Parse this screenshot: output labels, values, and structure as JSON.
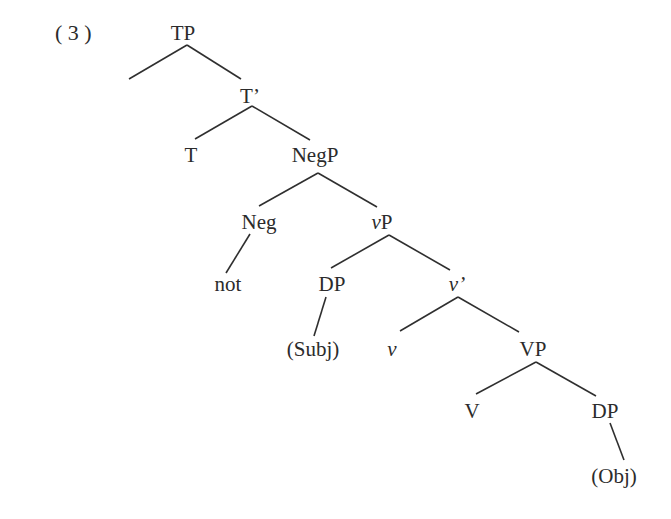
{
  "example_number": "( 3 )",
  "tree": {
    "nodes": [
      {
        "id": "TP",
        "label": "TP",
        "x": 183,
        "y": 40,
        "italic": false
      },
      {
        "id": "Tbar",
        "label": "T’",
        "x": 250,
        "y": 103,
        "italic": false
      },
      {
        "id": "T",
        "label": "T",
        "x": 191,
        "y": 162,
        "italic": false
      },
      {
        "id": "NegP",
        "label": "NegP",
        "x": 315,
        "y": 162,
        "italic": false
      },
      {
        "id": "Neg",
        "label": "Neg",
        "x": 259,
        "y": 229,
        "italic": false
      },
      {
        "id": "vP",
        "label": "vP",
        "x": 382,
        "y": 229,
        "italic": true
      },
      {
        "id": "not",
        "label": "not",
        "x": 228,
        "y": 291,
        "italic": false
      },
      {
        "id": "DP1",
        "label": "DP",
        "x": 332,
        "y": 291,
        "italic": false
      },
      {
        "id": "vbar",
        "label": "v’",
        "x": 457,
        "y": 291,
        "italic": true
      },
      {
        "id": "Subj",
        "label": "(Subj)",
        "x": 313,
        "y": 356,
        "italic": false
      },
      {
        "id": "v",
        "label": "v",
        "x": 392,
        "y": 356,
        "italic": true
      },
      {
        "id": "VP",
        "label": "VP",
        "x": 533,
        "y": 356,
        "italic": false
      },
      {
        "id": "V",
        "label": "V",
        "x": 472,
        "y": 418,
        "italic": false
      },
      {
        "id": "DP2",
        "label": "DP",
        "x": 605,
        "y": 418,
        "italic": false
      },
      {
        "id": "Obj",
        "label": "(Obj)",
        "x": 614,
        "y": 483,
        "italic": false
      }
    ],
    "edges": [
      {
        "from": "TP",
        "x1": 187,
        "y1": 45,
        "x2": 129,
        "y2": 79
      },
      {
        "from": "TP",
        "x1": 187,
        "y1": 45,
        "x2": 241,
        "y2": 79
      },
      {
        "from": "Tbar",
        "x1": 252,
        "y1": 106,
        "x2": 195,
        "y2": 139
      },
      {
        "from": "Tbar",
        "x1": 252,
        "y1": 106,
        "x2": 310,
        "y2": 140
      },
      {
        "from": "NegP",
        "x1": 318,
        "y1": 173,
        "x2": 259,
        "y2": 206
      },
      {
        "from": "NegP",
        "x1": 318,
        "y1": 173,
        "x2": 377,
        "y2": 207
      },
      {
        "from": "Neg",
        "x1": 250,
        "y1": 234,
        "x2": 226,
        "y2": 273
      },
      {
        "from": "vP",
        "x1": 389,
        "y1": 235,
        "x2": 331,
        "y2": 268
      },
      {
        "from": "vP",
        "x1": 389,
        "y1": 235,
        "x2": 450,
        "y2": 270
      },
      {
        "from": "DP1",
        "x1": 326,
        "y1": 297,
        "x2": 314,
        "y2": 336
      },
      {
        "from": "vbar",
        "x1": 458,
        "y1": 297,
        "x2": 400,
        "y2": 331
      },
      {
        "from": "vbar",
        "x1": 458,
        "y1": 297,
        "x2": 519,
        "y2": 332
      },
      {
        "from": "VP",
        "x1": 536,
        "y1": 362,
        "x2": 476,
        "y2": 394
      },
      {
        "from": "VP",
        "x1": 536,
        "y1": 362,
        "x2": 596,
        "y2": 396
      },
      {
        "from": "DP2",
        "x1": 610,
        "y1": 423,
        "x2": 624,
        "y2": 460
      }
    ]
  }
}
